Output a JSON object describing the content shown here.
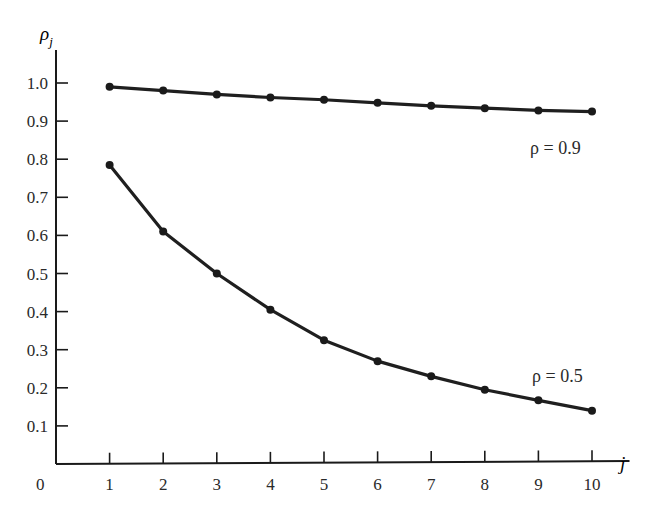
{
  "chart_data": {
    "type": "line",
    "title": "",
    "xlabel": "j",
    "ylabel": "ρ_j",
    "x": [
      1,
      2,
      3,
      4,
      5,
      6,
      7,
      8,
      9,
      10
    ],
    "xlim": [
      0,
      10.7
    ],
    "ylim": [
      0,
      1.1
    ],
    "x_ticks": [
      "1",
      "2",
      "3",
      "4",
      "5",
      "6",
      "7",
      "8",
      "9",
      "10"
    ],
    "y_ticks": [
      "0.1",
      "0.2",
      "0.3",
      "0.4",
      "0.5",
      "0.6",
      "0.7",
      "0.8",
      "0.9",
      "1.0"
    ],
    "origin_label": "0",
    "grid": false,
    "legend": "inline annotations",
    "series": [
      {
        "name": "ρ = 0.9",
        "values": [
          0.99,
          0.98,
          0.97,
          0.962,
          0.956,
          0.948,
          0.94,
          0.934,
          0.928,
          0.925
        ]
      },
      {
        "name": "ρ = 0.5",
        "values": [
          0.785,
          0.61,
          0.5,
          0.405,
          0.325,
          0.27,
          0.23,
          0.195,
          0.167,
          0.14
        ]
      }
    ],
    "annotations": [
      {
        "text": "ρ = 0.9",
        "near_x": 10,
        "near_y": 0.85
      },
      {
        "text": "ρ = 0.5",
        "near_x": 9.5,
        "near_y": 0.21
      }
    ]
  },
  "labels": {
    "y_axis_symbol": "ρ",
    "y_axis_sub": "j",
    "x_axis": "j",
    "origin": "0",
    "series_a": "ρ = 0.9",
    "series_b": "ρ = 0.5"
  }
}
